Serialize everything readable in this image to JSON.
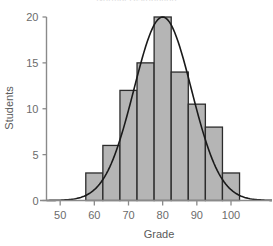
{
  "chart_data": {
    "type": "bar",
    "title": "Normal Distribution",
    "xlabel": "Grade",
    "ylabel": "Students",
    "categories": [
      "57.5-62.5",
      "62.5-67.5",
      "67.5-72.5",
      "72.5-77.5",
      "77.5-82.5",
      "82.5-87.5",
      "87.5-92.5",
      "92.5-97.5",
      "97.5-102.5"
    ],
    "bin_edges": [
      57.5,
      62.5,
      67.5,
      72.5,
      77.5,
      82.5,
      87.5,
      92.5,
      97.5,
      102.5
    ],
    "values": [
      3,
      6,
      12,
      15,
      20,
      14,
      10.5,
      8,
      3
    ],
    "xlim": [
      46,
      112
    ],
    "ylim": [
      0,
      20
    ],
    "xticks": [
      50,
      60,
      70,
      80,
      90,
      100
    ],
    "yticks": [
      0,
      5,
      10,
      15,
      20
    ],
    "xtick_labels": [
      "50",
      "60",
      "70",
      "80",
      "90",
      "100"
    ],
    "ytick_labels": [
      "0",
      "5",
      "10",
      "15",
      "20"
    ],
    "grid": false,
    "legend": "none",
    "overlay": {
      "type": "line",
      "name": "normal-curve",
      "mean": 80,
      "sigma": 8.4,
      "peak": 20
    },
    "colors": {
      "bar_fill": "#b5b5b5",
      "bar_stroke": "#2b2b2b",
      "curve": "#1a1a1a",
      "axis": "#8a8a8a",
      "text": "#5a5a5a",
      "background": "#ffffff"
    }
  }
}
